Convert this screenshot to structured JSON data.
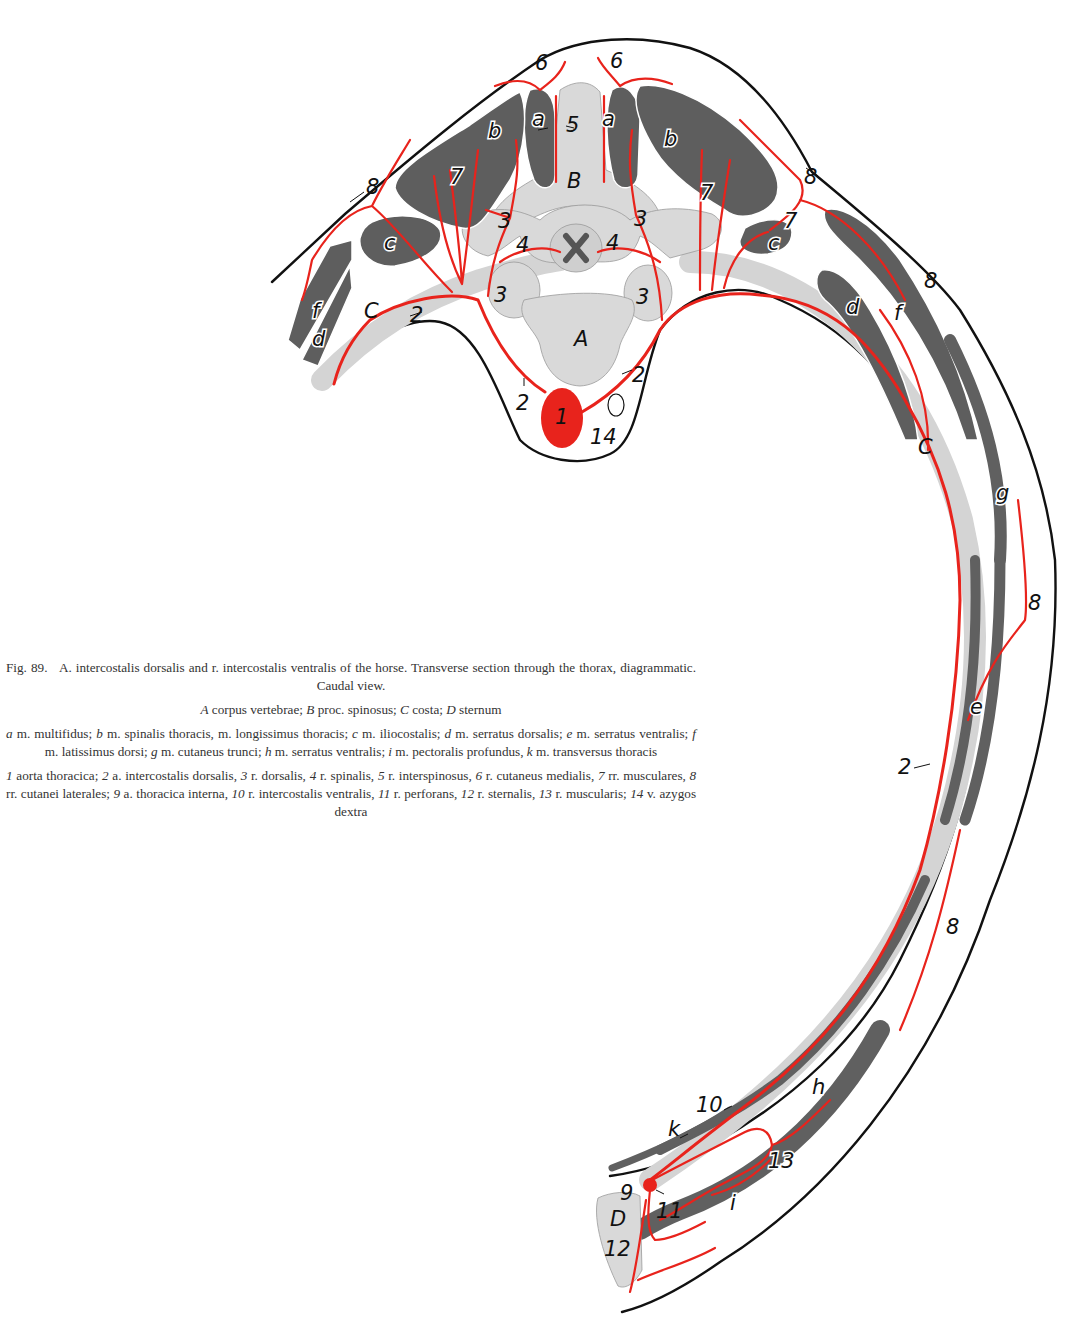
{
  "figure": {
    "number": "Fig. 89.",
    "title": "A. intercostalis dorsalis and r. intercostalis ventralis of the horse. Transverse section through the thorax, diagrammatic. Caudal view.",
    "view": "Caudal view",
    "colors": {
      "artery": "#e8231c",
      "bone": "#d9d9d9",
      "muscle": "#5e5e5e",
      "outline": "#111111",
      "background": "#ffffff"
    }
  },
  "caption": {
    "line1_prefix": "Fig. 89.",
    "line1_text": "A. intercostalis dorsalis and r. intercostalis ventralis of the horse. Transverse section through the thorax, diagrammatic. Caudal view.",
    "bones": [
      {
        "key": "A",
        "desc": "corpus vertebrae;"
      },
      {
        "key": "B",
        "desc": "proc. spinosus;"
      },
      {
        "key": "C",
        "desc": "costa;"
      },
      {
        "key": "D",
        "desc": "sternum"
      }
    ],
    "muscles": [
      {
        "key": "a",
        "desc": "m. multifidus;"
      },
      {
        "key": "b",
        "desc": "m. spinalis thoracis, m. longissimus thoracis;"
      },
      {
        "key": "c",
        "desc": "m. iliocostalis;"
      },
      {
        "key": "d",
        "desc": "m. serratus dorsalis;"
      },
      {
        "key": "e",
        "desc": "m. serratus ventralis;"
      },
      {
        "key": "f",
        "desc": "m. latissimus dorsi;"
      },
      {
        "key": "g",
        "desc": "m. cutaneus trunci;"
      },
      {
        "key": "h",
        "desc": "m. serratus ventralis;"
      },
      {
        "key": "i",
        "desc": "m. pectoralis profundus,"
      },
      {
        "key": "k",
        "desc": "m. transversus thoracis"
      }
    ],
    "vessels": [
      {
        "key": "1",
        "desc": "aorta thoracica;"
      },
      {
        "key": "2",
        "desc": "a. intercostalis dorsalis,"
      },
      {
        "key": "3",
        "desc": "r. dorsalis,"
      },
      {
        "key": "4",
        "desc": "r. spinalis,"
      },
      {
        "key": "5",
        "desc": "r. interspinosus,"
      },
      {
        "key": "6",
        "desc": "r. cutaneus medialis,"
      },
      {
        "key": "7",
        "desc": "rr. musculares,"
      },
      {
        "key": "8",
        "desc": "rr. cutanei laterales;"
      },
      {
        "key": "9",
        "desc": "a. thoracica interna,"
      },
      {
        "key": "10",
        "desc": "r. intercostalis ventralis,"
      },
      {
        "key": "11",
        "desc": "r. perforans,"
      },
      {
        "key": "12",
        "desc": "r. sternalis,"
      },
      {
        "key": "13",
        "desc": "r. muscularis;"
      },
      {
        "key": "14",
        "desc": "v. azygos dextra"
      }
    ]
  },
  "labels": {
    "bone_A": "A",
    "bone_B": "B",
    "bone_C_left": "C",
    "bone_C_right": "C",
    "bone_D": "D",
    "muscle_a_left": "a",
    "muscle_a_right": "a",
    "muscle_b_left": "b",
    "muscle_b_right": "b",
    "muscle_c_left": "c",
    "muscle_c_right": "c",
    "muscle_d_left": "d",
    "muscle_d_right": "d",
    "muscle_e": "e",
    "muscle_f_left": "f",
    "muscle_f_right": "f",
    "muscle_g": "g",
    "muscle_h": "h",
    "muscle_i": "i",
    "muscle_k": "k",
    "v1": "1",
    "v2_left_rib": "2",
    "v2_left_low": "2",
    "v2_right_low": "2",
    "v2_lateral": "2",
    "v3_ul": "3",
    "v3_ur": "3",
    "v3_ll": "3",
    "v3_lr": "3",
    "v4_left": "4",
    "v4_right": "4",
    "v5": "5",
    "v6_left": "6",
    "v6_right": "6",
    "v7_left": "7",
    "v7_right_upper": "7",
    "v7_right_c": "7",
    "v8_left": "8",
    "v8_top_right": "8",
    "v8_right_2": "8",
    "v8_right_3": "8",
    "v8_right_4": "8",
    "v9": "9",
    "v10": "10",
    "v11": "11",
    "v12": "12",
    "v13": "13",
    "v14": "14"
  }
}
